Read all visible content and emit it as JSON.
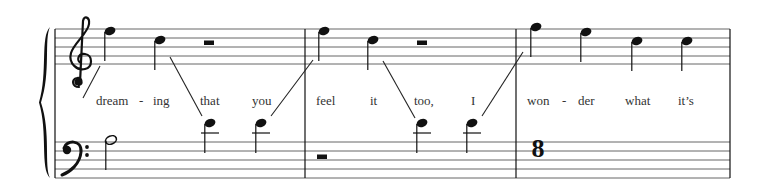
{
  "score": {
    "width": 766,
    "height": 191,
    "colors": {
      "ink": "#111111",
      "staff_line": "#666666",
      "lyric": "#333333",
      "background": "#ffffff"
    },
    "system": {
      "left_x": 55,
      "right_x": 730,
      "brace": {
        "x": 44,
        "top": 27,
        "bottom": 178
      },
      "barlines_x": [
        305,
        516,
        730
      ]
    },
    "staves": [
      {
        "name": "treble",
        "clef": "treble-clef",
        "clef_glyph": "𝄞",
        "lines_y": [
          29,
          38,
          47,
          56,
          64
        ]
      },
      {
        "name": "bass",
        "clef": "bass-clef",
        "clef_glyph": "𝄢",
        "lines_y": [
          142,
          151,
          160,
          169,
          178
        ]
      }
    ],
    "measures": [
      {
        "number": 1,
        "treble": [
          {
            "type": "quarter",
            "pitch": "F5",
            "x": 110,
            "y": 31
          },
          {
            "type": "quarter",
            "pitch": "D5",
            "x": 160,
            "y": 40
          },
          {
            "type": "half-rest",
            "x": 209,
            "y": 43
          }
        ],
        "bass": [
          {
            "type": "half",
            "pitch": "A3",
            "x": 111,
            "y": 140
          },
          {
            "type": "quarter",
            "pitch": "D4",
            "x": 210,
            "y": 123,
            "ledger_y": 133
          },
          {
            "type": "quarter",
            "pitch": "D4",
            "x": 261,
            "y": 123,
            "ledger_y": 133
          }
        ]
      },
      {
        "number": 2,
        "treble": [
          {
            "type": "quarter",
            "pitch": "F5",
            "x": 324,
            "y": 31
          },
          {
            "type": "quarter",
            "pitch": "D5",
            "x": 373,
            "y": 40
          },
          {
            "type": "half-rest",
            "x": 422,
            "y": 43
          }
        ],
        "bass": [
          {
            "type": "half-rest",
            "x": 322,
            "y": 157
          },
          {
            "type": "quarter",
            "pitch": "D4",
            "x": 422,
            "y": 123,
            "ledger_y": 133
          },
          {
            "type": "quarter",
            "pitch": "D4",
            "x": 472,
            "y": 123,
            "ledger_y": 133
          }
        ]
      },
      {
        "number": 3,
        "treble": [
          {
            "type": "quarter",
            "pitch": "G5",
            "x": 536,
            "y": 27
          },
          {
            "type": "quarter",
            "pitch": "F5",
            "x": 586,
            "y": 32
          },
          {
            "type": "quarter",
            "pitch": "D5",
            "x": 637,
            "y": 41
          },
          {
            "type": "quarter",
            "pitch": "D5",
            "x": 687,
            "y": 41
          }
        ],
        "bass": [
          {
            "type": "figure",
            "text": "8",
            "x": 538,
            "y": 157
          }
        ]
      }
    ],
    "voice_lines": [
      {
        "x1": 100,
        "y1": 66,
        "x2": 83,
        "y2": 98
      },
      {
        "x1": 170,
        "y1": 57,
        "x2": 202,
        "y2": 116
      },
      {
        "x1": 271,
        "y1": 116,
        "x2": 313,
        "y2": 60
      },
      {
        "x1": 383,
        "y1": 61,
        "x2": 415,
        "y2": 118
      },
      {
        "x1": 482,
        "y1": 116,
        "x2": 523,
        "y2": 52
      }
    ],
    "lyrics": [
      {
        "text": "dream",
        "x": 96
      },
      {
        "text": "-",
        "x": 139
      },
      {
        "text": "ing",
        "x": 153
      },
      {
        "text": "that",
        "x": 200
      },
      {
        "text": "you",
        "x": 252
      },
      {
        "text": "feel",
        "x": 316
      },
      {
        "text": "it",
        "x": 370
      },
      {
        "text": "too,",
        "x": 414
      },
      {
        "text": "I",
        "x": 471
      },
      {
        "text": "won",
        "x": 527
      },
      {
        "text": "-",
        "x": 562
      },
      {
        "text": "der",
        "x": 578
      },
      {
        "text": "what",
        "x": 625
      },
      {
        "text": "it’s",
        "x": 678
      }
    ],
    "lyrics_baseline_y": 105
  }
}
